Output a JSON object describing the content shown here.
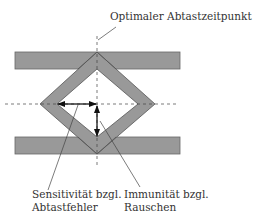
{
  "diagram": {
    "type": "eye-diagram",
    "colors": {
      "band_fill": "#999999",
      "band_stroke": "#555555",
      "line": "#333333",
      "background": "#ffffff"
    },
    "labels": {
      "optimal_sampling": "Optimaler Abtastzeitpunkt",
      "sensitivity_line1": "Sensitivität bzgl.",
      "sensitivity_line2": "Abtastfehler",
      "immunity_line1": "Immunität bzgl.",
      "immunity_line2": "Rauschen"
    }
  }
}
